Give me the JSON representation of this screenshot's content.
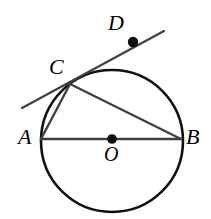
{
  "figure": {
    "width": 211,
    "height": 219,
    "background_color": "#ffffff"
  },
  "labels": {
    "A": "A",
    "B": "B",
    "C": "C",
    "D": "D",
    "O": "O"
  },
  "geometry": {
    "circle": {
      "name": "circle-O",
      "cx": 112,
      "cy": 141,
      "r": 71,
      "stroke_color": "#111111",
      "stroke_width": 2.6,
      "fill": "none"
    },
    "points": [
      {
        "name": "point-A",
        "label": "A",
        "x": 41,
        "y": 139,
        "dot": false
      },
      {
        "name": "point-B",
        "label": "B",
        "x": 181,
        "y": 139,
        "dot": false
      },
      {
        "name": "point-C",
        "label": "C",
        "x": 70,
        "y": 84,
        "dot": false
      },
      {
        "name": "point-D",
        "label": "D",
        "x": 133,
        "y": 42,
        "dot": true,
        "dot_r": 5.2
      },
      {
        "name": "point-O",
        "label": "O",
        "x": 112,
        "y": 139,
        "dot": true,
        "dot_r": 4.8
      }
    ],
    "segments": [
      {
        "name": "diameter-AB",
        "from": "A",
        "to": "B",
        "x1": 41,
        "y1": 139,
        "x2": 181,
        "y2": 139,
        "stroke_color": "#3f3f46",
        "stroke_width": 2.4
      },
      {
        "name": "chord-CB",
        "from": "C",
        "to": "B",
        "x1": 70,
        "y1": 84,
        "x2": 181,
        "y2": 139,
        "stroke_color": "#3f3f46",
        "stroke_width": 2.4
      },
      {
        "name": "chord-CA",
        "from": "C",
        "to": "A",
        "x1": 70,
        "y1": 84,
        "x2": 41,
        "y2": 139,
        "stroke_color": "#3f3f46",
        "stroke_width": 2.4
      },
      {
        "name": "tangent-line-CD",
        "from": "tangent-left-end",
        "to": "tangent-right-end",
        "x1": 22,
        "y1": 108,
        "x2": 164,
        "y2": 31,
        "stroke_color": "#3f3f46",
        "stroke_width": 2.2
      }
    ]
  }
}
